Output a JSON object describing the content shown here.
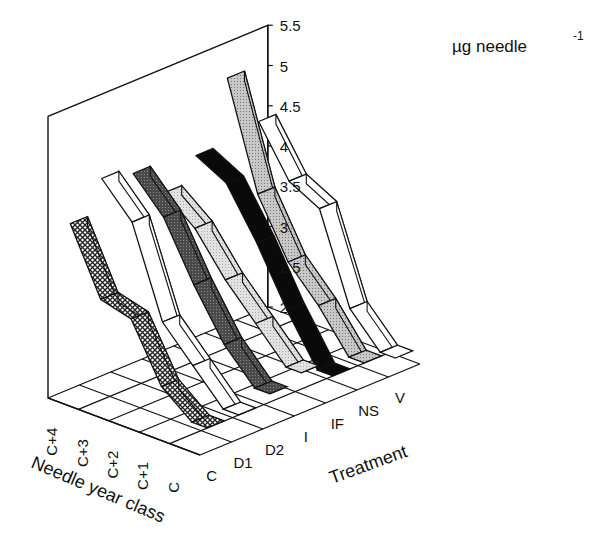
{
  "chart_data": {
    "type": "3d-ribbon",
    "title": "",
    "zlabel": "µg needle",
    "zlabel_superscript": "-1",
    "xlabel": "Treatment",
    "ylabel": "Needle year class",
    "zlim": [
      2,
      5.5
    ],
    "zticks": [
      "5.5",
      "5",
      "4.5",
      "4",
      "3.5",
      "3",
      "2.5",
      "2"
    ],
    "categories": [
      "C",
      "D1",
      "D2",
      "I",
      "IF",
      "NS",
      "V"
    ],
    "year_classes": [
      "C",
      "C+1",
      "C+2",
      "C+3",
      "C+4"
    ],
    "grid": true,
    "legend": "none",
    "series": [
      {
        "name": "C",
        "fill": "crosshatch",
        "values": {
          "C": 2.3,
          "C+1": 2.6,
          "C+2": 3.3,
          "C+3": 3.4,
          "C+4": 4.2
        }
      },
      {
        "name": "D1",
        "fill": "white",
        "values": {
          "C": 2.3,
          "C+1": 2.7,
          "C+2": 3.1,
          "C+3": 4.2,
          "C+4": 4.6
        }
      },
      {
        "name": "D2",
        "fill": "dark-gray",
        "values": {
          "C": 2.4,
          "C+1": 2.8,
          "C+2": 3.4,
          "C+3": 4.1,
          "C+4": 4.5
        }
      },
      {
        "name": "I",
        "fill": "light-gray",
        "values": {
          "C": 2.5,
          "C+1": 2.9,
          "C+2": 3.3,
          "C+3": 3.8,
          "C+4": 4.1
        }
      },
      {
        "name": "IF",
        "fill": "black",
        "values": {
          "C": 2.3,
          "C+1": 2.9,
          "C+2": 3.6,
          "C+3": 4.2,
          "C+4": 4.4
        }
      },
      {
        "name": "NS",
        "fill": "mid-gray",
        "values": {
          "C": 2.3,
          "C+1": 2.8,
          "C+2": 3.2,
          "C+3": 3.9,
          "C+4": 5.2
        }
      },
      {
        "name": "V",
        "fill": "white",
        "values": {
          "C": 2.2,
          "C+1": 2.6,
          "C+2": 3.7,
          "C+3": 3.9,
          "C+4": 4.5
        }
      }
    ]
  },
  "labels": {
    "unit": "µg needle",
    "unit_sup": "-1",
    "treatment_axis": "Treatment",
    "year_axis": "Needle year class"
  }
}
